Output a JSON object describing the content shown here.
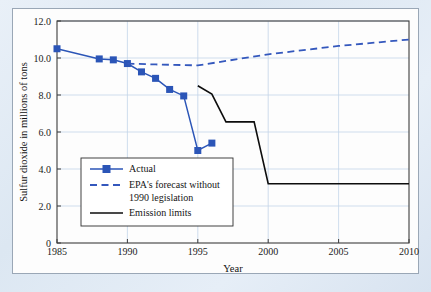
{
  "figure": {
    "background_color": "#dfe8f3",
    "plate_color": "#fdfdfd",
    "border_color": "#9aa7b6"
  },
  "chart_data": {
    "type": "line",
    "title": "",
    "xlabel": "Year",
    "ylabel": "Sulfur dioxide in millions of tons",
    "xlim": [
      1985,
      2010
    ],
    "ylim": [
      0,
      12
    ],
    "grid": true,
    "legend_position": "inside-lower-left",
    "xticks": [
      "1985",
      "1990",
      "1995",
      "2000",
      "2005",
      "2010"
    ],
    "xtick_values": [
      1985,
      1990,
      1995,
      2000,
      2005,
      2010
    ],
    "yticks": [
      "0",
      "2.0",
      "4.0",
      "6.0",
      "8.0",
      "10.0",
      "12.0"
    ],
    "ytick_values": [
      0,
      2,
      4,
      6,
      8,
      10,
      12
    ],
    "series": [
      {
        "name": "Actual",
        "style": "solid-with-square-markers",
        "color": "#2b55b7",
        "markers": true,
        "x": [
          1985,
          1988,
          1989,
          1990,
          1991,
          1992,
          1993,
          1994,
          1995,
          1996
        ],
        "values": [
          10.5,
          9.95,
          9.9,
          9.7,
          9.25,
          8.9,
          8.3,
          7.95,
          5.0,
          5.4
        ]
      },
      {
        "name": "EPA's forecast without 1990 legislation",
        "style": "dashed",
        "color": "#3458bd",
        "markers": false,
        "x": [
          1990,
          1992,
          1995,
          2000,
          2005,
          2010
        ],
        "values": [
          9.7,
          9.65,
          9.6,
          10.2,
          10.65,
          11.0
        ]
      },
      {
        "name": "Emission limits",
        "style": "solid",
        "color": "#0d0d0d",
        "markers": false,
        "x": [
          1995,
          1996,
          1997,
          1999,
          2000,
          2010
        ],
        "values": [
          8.5,
          8.05,
          6.55,
          6.55,
          3.2,
          3.2
        ]
      }
    ]
  },
  "legend": {
    "entries": [
      {
        "label": "Actual",
        "swatch": "blue-square-line"
      },
      {
        "label": "EPA's forecast without",
        "swatch": "blue-dashed-line"
      },
      {
        "label": "1990 legislation",
        "swatch": "none"
      },
      {
        "label": "Emission limits",
        "swatch": "black-solid-line"
      }
    ]
  }
}
